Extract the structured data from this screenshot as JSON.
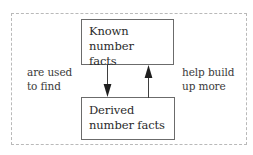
{
  "diagram": {
    "title_visible": false,
    "frame": {
      "name": "dashed-outer-frame",
      "style": "dashed",
      "color": "#b9b9b9"
    },
    "nodes": [
      {
        "id": "known",
        "label": "Known number facts",
        "label_lines": [
          "Known number",
          "facts"
        ],
        "border_color": "#6b6b6b",
        "fill_color": "#ffffff",
        "text_color": "#2b2b2b"
      },
      {
        "id": "derived",
        "label": "Derived number facts",
        "label_lines": [
          "Derived",
          "number facts"
        ],
        "border_color": "#6b6b6b",
        "fill_color": "#ffffff",
        "text_color": "#2b2b2b"
      }
    ],
    "edges": [
      {
        "id": "known-to-derived",
        "from": "known",
        "to": "derived",
        "direction": "down",
        "icon": "arrow-down-icon",
        "caption": "are used to find",
        "caption_lines": [
          "are used",
          "to find"
        ],
        "caption_side": "left",
        "color": "#3a3a3a"
      },
      {
        "id": "derived-to-known",
        "from": "derived",
        "to": "known",
        "direction": "up",
        "icon": "arrow-up-icon",
        "caption": "help build up more",
        "caption_lines": [
          "help build",
          "up more"
        ],
        "caption_side": "right",
        "color": "#3a3a3a"
      }
    ]
  }
}
